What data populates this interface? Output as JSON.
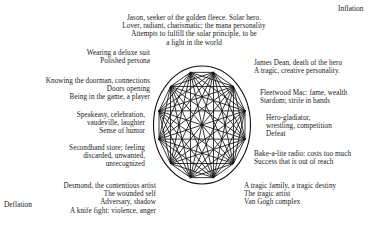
{
  "figure": {
    "title_poles": {
      "inflation": "Inflation",
      "deflation": "Deflation"
    },
    "diagram": {
      "name": "mandala-circle-with-inscribed-polygon",
      "shape": "circle",
      "vertices": 12,
      "stroke_color": "#111111",
      "description": "Circle enclosing a 12-vertex polygon with all chords/diagonals drawn"
    },
    "annotations": [
      {
        "id": "jason-solar-hero",
        "align": "center",
        "lines": [
          "Jason, seeker of the golden fleece. Solar hero.",
          "Lover, radiant, charismatic; the mana personality",
          "Attempts to fulfill the solar principle, to be",
          "a light in the world"
        ]
      },
      {
        "id": "deluxe-suit-persona",
        "align": "right",
        "lines": [
          "Wearing a deluxe suit",
          "Polished persona"
        ]
      },
      {
        "id": "knowing-the-doorman",
        "align": "right",
        "lines": [
          "Knowing the doorman,  connections",
          "Doors opening",
          "Being in the game, a player"
        ]
      },
      {
        "id": "speakeasy-celebration",
        "align": "right",
        "lines": [
          "Speakeasy, celebration,",
          "vaudeville,  laughter",
          "Sense of humor"
        ]
      },
      {
        "id": "secondhand-store",
        "align": "right",
        "lines": [
          "Secondhand store; feeling",
          "discarded, unwanted,",
          "unrecognized"
        ]
      },
      {
        "id": "desmond-contentious-artist",
        "align": "right",
        "lines": [
          "Desmond, the contentious artist",
          "The wounded self",
          "Adversary, shadow",
          "A knife fight: violence, anger"
        ]
      },
      {
        "id": "james-dean",
        "align": "left",
        "lines": [
          "James Dean, death of the hero",
          "A tragic, creative personality."
        ]
      },
      {
        "id": "fleetwood-mac",
        "align": "left",
        "lines": [
          "Fleetwood Mac: fame,  wealth",
          "Stardom; strife in bands"
        ]
      },
      {
        "id": "hero-gladiator",
        "align": "left",
        "lines": [
          "Hero-gladiator,",
          "wrestling, competition",
          "Defeat"
        ]
      },
      {
        "id": "bakealite-radio",
        "align": "left",
        "lines": [
          "Bake-a-lite radio: costs too much",
          "Success that is out of reach"
        ]
      },
      {
        "id": "tragic-family",
        "align": "left",
        "lines": [
          "A tragic family, a tragic destiny",
          "The tragic artist",
          "Van Gogh complex"
        ]
      }
    ]
  }
}
